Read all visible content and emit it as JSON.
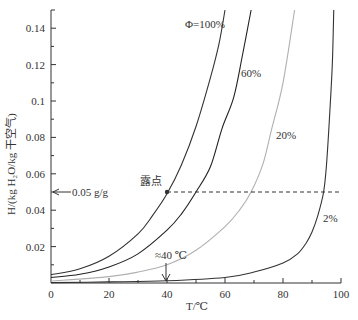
{
  "chart_data": {
    "type": "line",
    "title": "",
    "xlabel": "T/℃",
    "ylabel": "H/(kg H₂O/kg 干空气)",
    "xlim": [
      0,
      100
    ],
    "ylim": [
      0,
      0.15
    ],
    "xticks": [
      0,
      20,
      40,
      60,
      80,
      100
    ],
    "xtick_labels": [
      "0",
      "20",
      "40",
      "60",
      "80",
      "100"
    ],
    "yticks": [
      0.02,
      0.04,
      0.06,
      0.08,
      0.1,
      0.12,
      0.14
    ],
    "ytick_labels": [
      "0.02",
      "0.04",
      "0.06",
      "0.08",
      "0.1",
      "0.12",
      "0.14"
    ],
    "grid": false,
    "series": [
      {
        "name": "Φ=100%",
        "label": "Φ=100%",
        "color": "#333333",
        "points": [
          [
            0,
            0.0045
          ],
          [
            10,
            0.0078
          ],
          [
            20,
            0.0147
          ],
          [
            30,
            0.027
          ],
          [
            35,
            0.037
          ],
          [
            40,
            0.049
          ],
          [
            45,
            0.065
          ],
          [
            50,
            0.086
          ],
          [
            55,
            0.113
          ],
          [
            58,
            0.132
          ],
          [
            60,
            0.15
          ]
        ]
      },
      {
        "name": "60%",
        "label": "60%",
        "color": "#222222",
        "points": [
          [
            0,
            0.003
          ],
          [
            10,
            0.0048
          ],
          [
            20,
            0.0088
          ],
          [
            30,
            0.016
          ],
          [
            40,
            0.029
          ],
          [
            45,
            0.038
          ],
          [
            50,
            0.05
          ],
          [
            55,
            0.064
          ],
          [
            59,
            0.085
          ],
          [
            63,
            0.102
          ],
          [
            66,
            0.125
          ],
          [
            69,
            0.15
          ]
        ]
      },
      {
        "name": "20%",
        "label": "20%",
        "color": "#b0b0b0",
        "points": [
          [
            0,
            0.001
          ],
          [
            20,
            0.0035
          ],
          [
            30,
            0.006
          ],
          [
            40,
            0.01
          ],
          [
            50,
            0.018
          ],
          [
            60,
            0.031
          ],
          [
            65,
            0.04
          ],
          [
            69,
            0.05
          ],
          [
            73,
            0.065
          ],
          [
            76,
            0.084
          ],
          [
            80,
            0.11
          ],
          [
            84,
            0.15
          ]
        ]
      },
      {
        "name": "2%",
        "label": "2%",
        "color": "#333333",
        "points": [
          [
            0,
            0.0002
          ],
          [
            20,
            0.0006
          ],
          [
            40,
            0.0012
          ],
          [
            60,
            0.003
          ],
          [
            70,
            0.006
          ],
          [
            80,
            0.011
          ],
          [
            85,
            0.016
          ],
          [
            88,
            0.022
          ],
          [
            90,
            0.028
          ],
          [
            92,
            0.037
          ],
          [
            94,
            0.05
          ],
          [
            95,
            0.065
          ],
          [
            96,
            0.09
          ],
          [
            97,
            0.12
          ],
          [
            97.5,
            0.15
          ]
        ]
      }
    ],
    "annotations": [
      {
        "text": "←0.05 g/g",
        "x": 0,
        "y": 0.05,
        "type": "arrow"
      },
      {
        "text": "露点",
        "x": 40,
        "y": 0.05,
        "type": "point-label"
      },
      {
        "text": "≈40 ℃",
        "x": 40,
        "y": 0.004,
        "type": "arrow-down"
      },
      {
        "type": "dashed-line",
        "y": 0.05,
        "x_from": 40,
        "x_to": 100
      }
    ],
    "legend": "inline curve labels"
  },
  "labels": {
    "xlabel": "T/℃",
    "ylabel": "H/(kg H₂O/kg 干空气)",
    "phi100": "Φ=100%",
    "phi60": "60%",
    "phi20": "20%",
    "phi2": "2%",
    "arrow_left": "0.05 g/g",
    "dew_point": "露点",
    "approx40": "≈40 ℃"
  }
}
